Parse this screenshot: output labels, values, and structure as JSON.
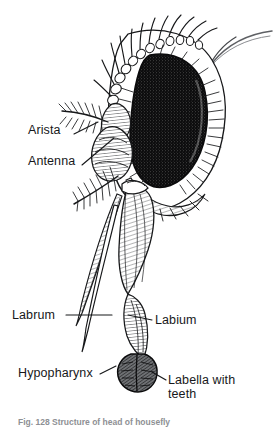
{
  "figure": {
    "background_color": "#ffffff",
    "ink_color": "#17181a",
    "width": 277,
    "height": 428
  },
  "labels": [
    {
      "id": "arista",
      "text": "Arista",
      "x": 28,
      "y": 130
    },
    {
      "id": "antenna",
      "text": "Antenna",
      "x": 28,
      "y": 161
    },
    {
      "id": "labrum",
      "text": "Labrum",
      "x": 12,
      "y": 310
    },
    {
      "id": "labium",
      "text": "Labium",
      "x": 155,
      "y": 318
    },
    {
      "id": "hypopharynx",
      "text": "Hypopharynx",
      "x": 18,
      "y": 369
    },
    {
      "id": "labella",
      "text": "Labella with teeth",
      "x": 168,
      "y": 383
    }
  ],
  "caption": {
    "text": "Fig. 128   Structure of head of housefly",
    "note": "clipped-at-image-bottom-edge"
  }
}
